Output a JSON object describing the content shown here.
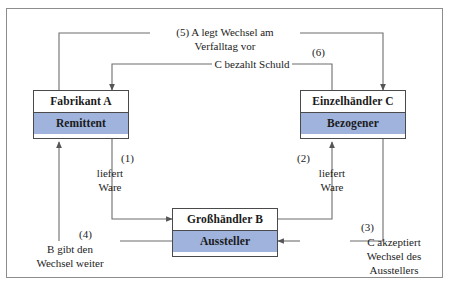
{
  "diagram": {
    "border_color": "#8d8d8d",
    "node_fill_accent": "#9fb3dd",
    "line_color": "#6d6d6d",
    "nodes": [
      {
        "id": "a",
        "party": "Fabrikant A",
        "role": "Remittent"
      },
      {
        "id": "c",
        "party": "Einzelhändler C",
        "role": "Bezogener"
      },
      {
        "id": "b",
        "party": "Großhändler B",
        "role": "Aussteller"
      }
    ],
    "flows": [
      {
        "number": "(1)",
        "text_line1": "liefert",
        "text_line2": "Ware",
        "from": "b",
        "to": "a"
      },
      {
        "number": "(2)",
        "text_line1": "liefert",
        "text_line2": "Ware",
        "from": "b",
        "to": "c"
      },
      {
        "number": "(3)",
        "text_line1": "C akzeptiert",
        "text_line2": "Wechsel des",
        "text_line3": "Ausstellers",
        "from": "c",
        "to": "b"
      },
      {
        "number": "(4)",
        "text_line1": "B gibt den",
        "text_line2": "Wechsel weiter",
        "from": "b",
        "to": "a"
      },
      {
        "number": "(5)",
        "text_line1": "(5) A legt Wechsel am",
        "text_line2": "Verfalltag vor",
        "from": "a",
        "to": "c"
      },
      {
        "number": "(6)",
        "text_line1": "C bezahlt Schuld",
        "from": "c",
        "to": "a"
      }
    ],
    "labels": {
      "flow5_line1": "(5) A legt Wechsel am",
      "flow5_line2": "Verfalltag vor",
      "flow6_tag": "(6)",
      "flow6_text": "C bezahlt Schuld",
      "flow1_tag": "(1)",
      "flow1_line1": "liefert",
      "flow1_line2": "Ware",
      "flow2_tag": "(2)",
      "flow2_line1": "liefert",
      "flow2_line2": "Ware",
      "flow3_tag": "(3)",
      "flow3_line1": "C akzeptiert",
      "flow3_line2": "Wechsel des",
      "flow3_line3": "Ausstellers",
      "flow4_tag": "(4)",
      "flow4_line1": "B gibt den",
      "flow4_line2": "Wechsel weiter",
      "node_a_party": "Fabrikant A",
      "node_a_role": "Remittent",
      "node_c_party": "Einzelhändler C",
      "node_c_role": "Bezogener",
      "node_b_party": "Großhändler B",
      "node_b_role": "Aussteller"
    }
  }
}
